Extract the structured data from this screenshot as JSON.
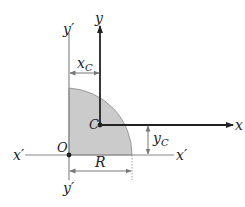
{
  "diagram": {
    "labels": {
      "y_axis": "y",
      "x_axis": "x",
      "y_prime_top": "y′",
      "y_prime_bottom": "y′",
      "x_prime_left": "x′",
      "x_prime_right": "x′",
      "origin": "O",
      "centroid": "C",
      "radius": "R",
      "xc_base": "x",
      "xc_sub": "C",
      "yc_base": "y",
      "yc_sub": "C"
    },
    "colors": {
      "shape_fill": "#c8c8c8",
      "shape_edge": "#9a9a9a",
      "axis": "#222222",
      "prime_axis": "#888888",
      "dimension": "#777777"
    }
  }
}
